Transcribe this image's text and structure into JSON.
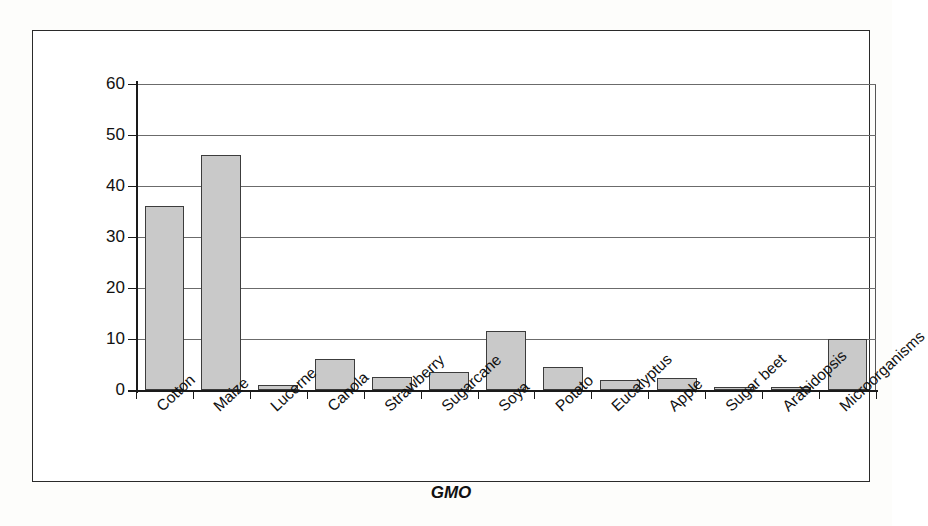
{
  "chart_data": {
    "type": "bar",
    "title": "",
    "xlabel": "GMO",
    "ylabel": "Number of applications",
    "ylim": [
      0,
      60
    ],
    "yticks": [
      0,
      10,
      20,
      30,
      40,
      50,
      60
    ],
    "grid": true,
    "legend": false,
    "bar_color": "#c9c9c9",
    "bar_edge_color": "#3c3c3c",
    "axis_color": "#1a1a1a",
    "categories": [
      "Cotton",
      "Maize",
      "Lucerne",
      "Canola",
      "Strawberry",
      "Sugarcane",
      "Soya",
      "Potato",
      "Eucalyptus",
      "Apple",
      "Sugar beet",
      "Arabidopsis",
      "Microorganisms"
    ],
    "values": [
      36,
      46,
      1,
      6,
      2.5,
      3.5,
      11.5,
      4.5,
      2,
      2.4,
      0.5,
      0.5,
      10
    ]
  }
}
